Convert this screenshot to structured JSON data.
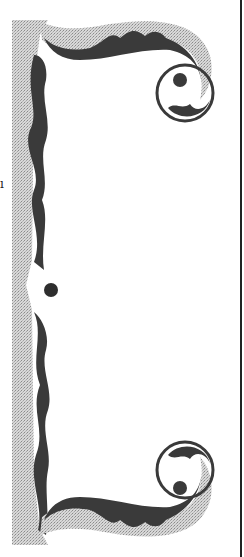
{
  "image": {
    "subject": "decorative ornamental bracket",
    "colors": {
      "stipple": "#c8c8c8",
      "stipple_dark": "#9a9a9a",
      "ink": "#3a3a3a",
      "background": "#ffffff"
    }
  },
  "stray_mark": "ı"
}
